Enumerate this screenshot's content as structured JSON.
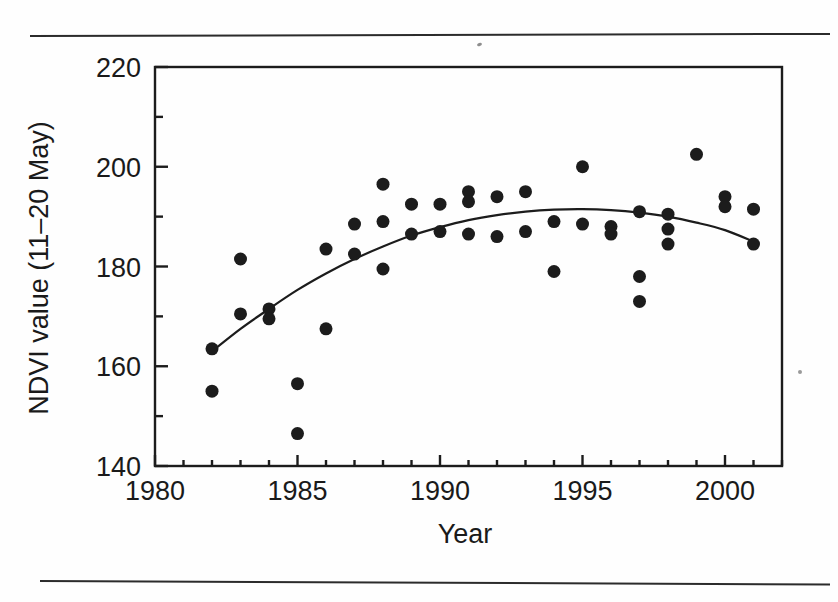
{
  "figure": {
    "kind": "scientific-figure-scan",
    "background_color": "#fefefe",
    "ink_color": "#1a1a1a",
    "has_top_rule": true,
    "has_bottom_rule": true
  },
  "chart_data": {
    "type": "scatter",
    "title": "",
    "subtitle": "",
    "xlabel": "Year",
    "ylabel": "NDVI value (11–20 May)",
    "xlim": [
      1980,
      2002
    ],
    "ylim": [
      140,
      220
    ],
    "x_major_ticks": [
      1980,
      1985,
      1990,
      1995,
      2000
    ],
    "x_major_tick_labels": [
      "1980",
      "1985",
      "1990",
      "1995",
      "2000"
    ],
    "x_minor_tick_step": 1,
    "y_major_ticks": [
      140,
      160,
      180,
      200,
      220
    ],
    "y_major_tick_labels": [
      "140",
      "160",
      "180",
      "200",
      "220"
    ],
    "y_minor_ticks": [
      150,
      170,
      190,
      210
    ],
    "grid": false,
    "legend": null,
    "marker": {
      "shape": "circle",
      "color": "#1c1c1c",
      "size_px": 13
    },
    "points": [
      {
        "x": 1982,
        "y": 163.5
      },
      {
        "x": 1982,
        "y": 155.0
      },
      {
        "x": 1983,
        "y": 181.5
      },
      {
        "x": 1983,
        "y": 170.5
      },
      {
        "x": 1984,
        "y": 171.5
      },
      {
        "x": 1984,
        "y": 169.5
      },
      {
        "x": 1985,
        "y": 156.5
      },
      {
        "x": 1985,
        "y": 146.5
      },
      {
        "x": 1986,
        "y": 183.5
      },
      {
        "x": 1986,
        "y": 167.5
      },
      {
        "x": 1987,
        "y": 188.5
      },
      {
        "x": 1987,
        "y": 182.5
      },
      {
        "x": 1988,
        "y": 196.5
      },
      {
        "x": 1988,
        "y": 189.0
      },
      {
        "x": 1988,
        "y": 179.5
      },
      {
        "x": 1989,
        "y": 192.5
      },
      {
        "x": 1989,
        "y": 186.5
      },
      {
        "x": 1990,
        "y": 192.5
      },
      {
        "x": 1990,
        "y": 187.0
      },
      {
        "x": 1991,
        "y": 195.0
      },
      {
        "x": 1991,
        "y": 193.0
      },
      {
        "x": 1991,
        "y": 186.5
      },
      {
        "x": 1992,
        "y": 194.0
      },
      {
        "x": 1992,
        "y": 186.0
      },
      {
        "x": 1993,
        "y": 195.0
      },
      {
        "x": 1993,
        "y": 187.0
      },
      {
        "x": 1994,
        "y": 189.0
      },
      {
        "x": 1994,
        "y": 179.0
      },
      {
        "x": 1995,
        "y": 200.0
      },
      {
        "x": 1995,
        "y": 188.5
      },
      {
        "x": 1996,
        "y": 188.0
      },
      {
        "x": 1996,
        "y": 186.5
      },
      {
        "x": 1997,
        "y": 191.0
      },
      {
        "x": 1997,
        "y": 178.0
      },
      {
        "x": 1997,
        "y": 173.0
      },
      {
        "x": 1998,
        "y": 190.5
      },
      {
        "x": 1998,
        "y": 187.5
      },
      {
        "x": 1998,
        "y": 184.5
      },
      {
        "x": 1999,
        "y": 202.5
      },
      {
        "x": 2000,
        "y": 194.0
      },
      {
        "x": 2000,
        "y": 192.0
      },
      {
        "x": 2001,
        "y": 191.5
      },
      {
        "x": 2001,
        "y": 184.5
      }
    ],
    "fit_curve": {
      "name": "smoothed trend",
      "style": "solid",
      "color": "#1c1c1c",
      "x": [
        1982,
        1983,
        1984,
        1985,
        1986,
        1987,
        1988,
        1989,
        1990,
        1991,
        1992,
        1993,
        1994,
        1995,
        1996,
        1997,
        1998,
        1999,
        2000,
        2001
      ],
      "y": [
        163.0,
        167.5,
        171.5,
        175.3,
        178.6,
        181.5,
        184.0,
        186.2,
        187.9,
        189.3,
        190.3,
        191.0,
        191.4,
        191.5,
        191.3,
        190.8,
        190.0,
        188.8,
        187.3,
        185.0
      ]
    }
  }
}
